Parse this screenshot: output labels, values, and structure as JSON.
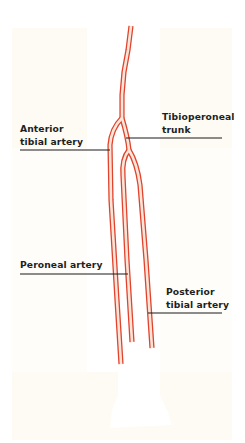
{
  "figure": {
    "type": "anatomical-diagram",
    "colors": {
      "background": "#ffffff",
      "panel": "#fdfbf4",
      "leg_silhouette": "#ffffff",
      "vessel_outline": "#e0432e",
      "vessel_fill": "#fde6d8",
      "leader_line": "#1a1a1a",
      "label_text": "#1f1f1f"
    }
  },
  "labels": {
    "anterior_tibial": {
      "line1": "Anterior",
      "line2": "tibial artery"
    },
    "tibioperoneal": {
      "line1": "Tibioperoneal",
      "line2": "trunk"
    },
    "peroneal": {
      "line1": "Peroneal artery"
    },
    "posterior_tibial": {
      "line1": "Posterior",
      "line2": "tibial artery"
    }
  }
}
